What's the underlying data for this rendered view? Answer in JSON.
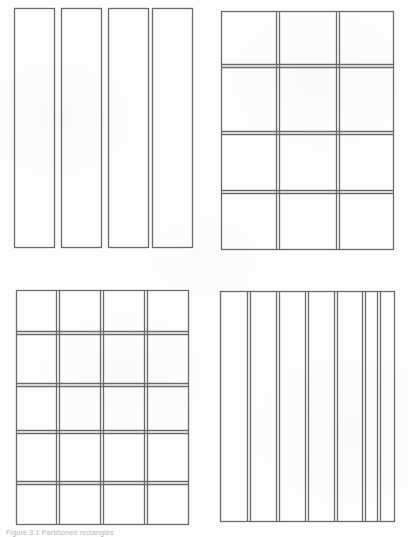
{
  "page": {
    "background_color": "#fdfdfc",
    "ink_color": "#6b6b6b",
    "ink_color_dark": "#5a5a5a",
    "width": 408,
    "height": 537,
    "caption_text": "Figure 3.1 Partitioned rectangles"
  },
  "figures": [
    {
      "id": "figure-top-left",
      "name": "four-separate-vertical-strips",
      "type": "separate-strips",
      "label": "Four separate vertical strips",
      "position": {
        "x": 13,
        "y": 7,
        "width": 180,
        "height": 243
      },
      "parts": 4,
      "rows": 1,
      "columns": 4,
      "separated": true,
      "strip_width": 40,
      "strip_gap": 7,
      "strip_height": 240,
      "interior_lines": "none"
    },
    {
      "id": "figure-top-right",
      "name": "grid-3-by-4",
      "type": "grid",
      "label": "Rectangle partitioned into 3 columns by 4 rows",
      "position": {
        "x": 221,
        "y": 11,
        "width": 173,
        "height": 239
      },
      "columns": 3,
      "rows": 4,
      "cells": 12,
      "column_lines_x": [
        278,
        338
      ],
      "row_lines_y": [
        66,
        133,
        192
      ],
      "line_style": "doubled"
    },
    {
      "id": "figure-bottom-left",
      "name": "grid-4-by-5",
      "type": "grid",
      "label": "Rectangle partitioned into 4 columns by 5 rows",
      "position": {
        "x": 15,
        "y": 290,
        "width": 174,
        "height": 235
      },
      "columns": 4,
      "rows": 5,
      "cells": 20,
      "column_lines_x": [
        58,
        102,
        146
      ],
      "row_lines_y": [
        333,
        385,
        432,
        483
      ],
      "line_style": "doubled"
    },
    {
      "id": "figure-bottom-right",
      "name": "columns-seven",
      "type": "columns",
      "label": "Rectangle partitioned into 7 vertical columns",
      "position": {
        "x": 220,
        "y": 291,
        "width": 174,
        "height": 230
      },
      "columns": 7,
      "rows": 1,
      "cells": 7,
      "column_lines_x": [
        248,
        277,
        305,
        334,
        362,
        378
      ],
      "row_lines_y": [],
      "line_style": "doubled"
    }
  ]
}
